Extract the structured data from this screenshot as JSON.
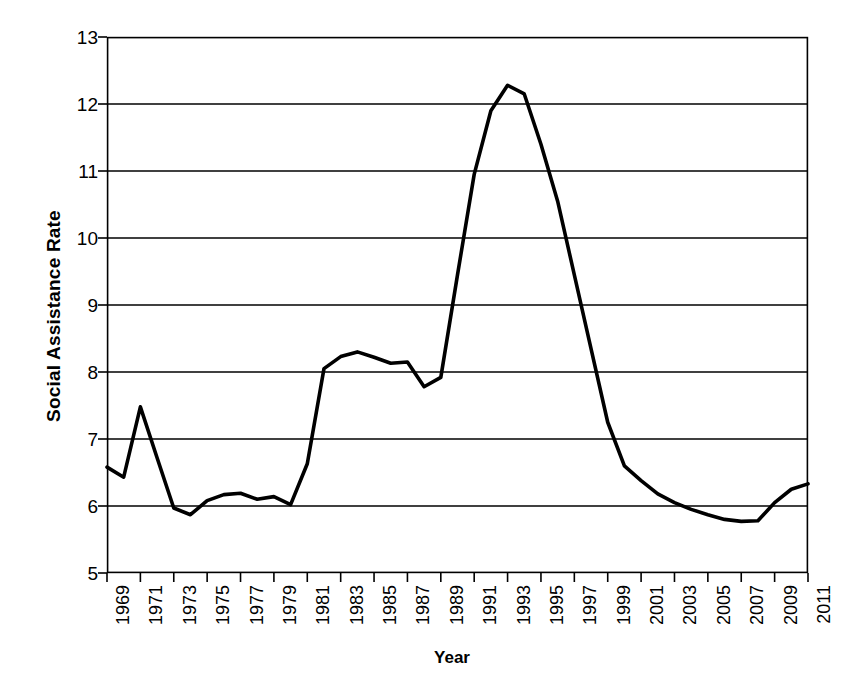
{
  "chart_data": {
    "type": "line",
    "title": "",
    "xlabel": "Year",
    "ylabel": "Social Assistance Rate",
    "xlim": [
      1969,
      2011
    ],
    "ylim": [
      5,
      13
    ],
    "ytick_step": 1,
    "xtick_step": 2,
    "grid": true,
    "legend": false,
    "line_color": "#000000",
    "grid_color": "#000000",
    "background": "#ffffff",
    "ytick_labels": [
      "13",
      "12",
      "11",
      "10",
      "9",
      "8",
      "7",
      "6",
      "5"
    ],
    "ytick_values": [
      13,
      12,
      11,
      10,
      9,
      8,
      7,
      6,
      5
    ],
    "xtick_labels": [
      "1969",
      "1971",
      "1973",
      "1975",
      "1977",
      "1979",
      "1981",
      "1983",
      "1985",
      "1987",
      "1989",
      "1991",
      "1993",
      "1995",
      "1997",
      "1999",
      "2001",
      "2003",
      "2005",
      "2007",
      "2009",
      "2011"
    ],
    "xtick_values": [
      1969,
      1971,
      1973,
      1975,
      1977,
      1979,
      1981,
      1983,
      1985,
      1987,
      1989,
      1991,
      1993,
      1995,
      1997,
      1999,
      2001,
      2003,
      2005,
      2007,
      2009,
      2011
    ],
    "x": [
      1969,
      1970,
      1971,
      1972,
      1973,
      1974,
      1975,
      1976,
      1977,
      1978,
      1979,
      1980,
      1981,
      1982,
      1983,
      1984,
      1985,
      1986,
      1987,
      1988,
      1989,
      1990,
      1991,
      1992,
      1993,
      1994,
      1995,
      1996,
      1997,
      1998,
      1999,
      2000,
      2001,
      2002,
      2003,
      2004,
      2005,
      2006,
      2007,
      2008,
      2009,
      2010,
      2011
    ],
    "values": [
      6.58,
      6.43,
      7.48,
      6.72,
      5.97,
      5.87,
      6.08,
      6.17,
      6.19,
      6.1,
      6.14,
      6.02,
      6.63,
      8.05,
      8.23,
      8.3,
      8.22,
      8.13,
      8.15,
      7.78,
      7.92,
      9.45,
      10.95,
      11.9,
      12.28,
      12.15,
      11.4,
      10.55,
      9.45,
      8.35,
      7.25,
      6.6,
      6.38,
      6.18,
      6.05,
      5.95,
      5.87,
      5.8,
      5.77,
      5.78,
      6.05,
      6.25,
      6.33
    ],
    "series": [
      {
        "name": "Social Assistance Rate",
        "values": [
          6.58,
          6.43,
          7.48,
          6.72,
          5.97,
          5.87,
          6.08,
          6.17,
          6.19,
          6.1,
          6.14,
          6.02,
          6.63,
          8.05,
          8.23,
          8.3,
          8.22,
          8.13,
          8.15,
          7.78,
          7.92,
          9.45,
          10.95,
          11.9,
          12.28,
          12.15,
          11.4,
          10.55,
          9.45,
          8.35,
          7.25,
          6.6,
          6.38,
          6.18,
          6.05,
          5.95,
          5.87,
          5.8,
          5.77,
          5.78,
          6.05,
          6.25,
          6.33
        ]
      }
    ],
    "annotations": []
  }
}
